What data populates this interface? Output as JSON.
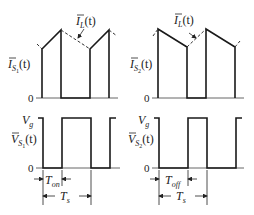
{
  "diagram": {
    "panels": [
      {
        "id": "is1",
        "ylabel": "I",
        "ysub": "S",
        "ysubsub": "1",
        "yarg": "(t)",
        "zero": "0",
        "annotation": "I",
        "annotation_sub": "L",
        "annotation_arg": "(t)"
      },
      {
        "id": "is2",
        "ylabel": "I",
        "ysub": "S",
        "ysubsub": "2",
        "yarg": "(t)",
        "zero": "0",
        "annotation": "I",
        "annotation_sub": "L",
        "annotation_arg": "(t)"
      },
      {
        "id": "vs1",
        "ylabel": "V",
        "ysub": "S",
        "ysubsub": "1",
        "yarg": "(t)",
        "zero": "0",
        "top": "V",
        "top_sub": "g",
        "interval": "T",
        "interval_sub": "on",
        "period": "T",
        "period_sub": "s"
      },
      {
        "id": "vs2",
        "ylabel": "V",
        "ysub": "S",
        "ysubsub": "2",
        "yarg": "(t)",
        "zero": "0",
        "top": "V",
        "top_sub": "g",
        "interval": "T",
        "interval_sub": "off",
        "period": "T",
        "period_sub": "s"
      }
    ]
  }
}
